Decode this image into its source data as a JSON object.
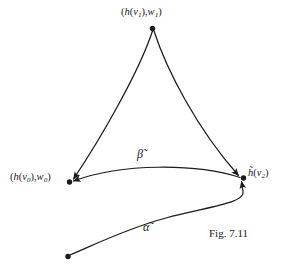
{
  "figure": {
    "caption": "Fig. 7.11",
    "background_color": "#ffffff",
    "ink_color": "#1a1a1a",
    "width": 284,
    "height": 273
  },
  "labels": {
    "top_vertex": "(h(v1),w1)",
    "left_vertex": "(h(v0),w0)",
    "right_vertex": "h̃(v2)",
    "beta_curve": "β̃",
    "alpha_curve": "α̃"
  },
  "vertices": [
    {
      "name": "top",
      "x": 152,
      "y": 28,
      "label": "(h(v1),w1)"
    },
    {
      "name": "left",
      "x": 69,
      "y": 182,
      "label": "(h(v0),w0)"
    },
    {
      "name": "right",
      "x": 243,
      "y": 178,
      "label": "h̃(v2)"
    },
    {
      "name": "alpha-start",
      "x": 68,
      "y": 256,
      "label": ""
    }
  ],
  "curves": [
    {
      "name": "left-side",
      "from": "top",
      "to": "left",
      "arrow_at": "left"
    },
    {
      "name": "right-side",
      "from": "top",
      "to": "right",
      "arrow_at": "right"
    },
    {
      "name": "beta",
      "from": "right",
      "to": "left",
      "arrow_at": "left",
      "label": "β̃"
    },
    {
      "name": "alpha",
      "from": "alpha-start",
      "to": "right",
      "arrow_at": "right",
      "label": "α̃"
    }
  ]
}
